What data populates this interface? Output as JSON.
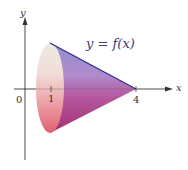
{
  "figure": {
    "function_label": "y = f(x)",
    "axes": {
      "x_label": "x",
      "y_label": "y",
      "origin_label": "0",
      "ticks": [
        "1",
        "4"
      ]
    },
    "solid": {
      "type": "cone of revolution about x-axis",
      "base_x": 1,
      "apex_x": 4
    },
    "colors": {
      "generating_line": "#2a2f8a",
      "axis": "#333333",
      "base_light": "#f3e4dc",
      "base_pink": "#e4707a",
      "side_blue": "#8c8cc8",
      "side_magenta": "#b0408a"
    }
  }
}
